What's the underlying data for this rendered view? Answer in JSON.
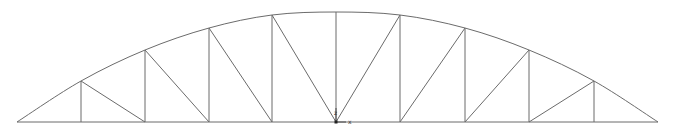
{
  "diagram": {
    "type": "bowstring-truss",
    "colors": {
      "member": "#6b6b6b",
      "axis": "#333333",
      "background": "#ffffff"
    },
    "bottom_chord_y": 122,
    "nodes_bottom_x": [
      17,
      81,
      145,
      209,
      272,
      336,
      400,
      465,
      529,
      594,
      658
    ],
    "nodes_top": [
      {
        "x": 17,
        "y": 122
      },
      {
        "x": 81,
        "y": 81
      },
      {
        "x": 145,
        "y": 50
      },
      {
        "x": 209,
        "y": 28
      },
      {
        "x": 272,
        "y": 15
      },
      {
        "x": 336,
        "y": 12
      },
      {
        "x": 400,
        "y": 15
      },
      {
        "x": 465,
        "y": 28
      },
      {
        "x": 529,
        "y": 50
      },
      {
        "x": 594,
        "y": 81
      },
      {
        "x": 658,
        "y": 122
      }
    ],
    "diagonals": [
      {
        "from": "top1",
        "to": "bot2"
      },
      {
        "from": "top2",
        "to": "bot3"
      },
      {
        "from": "top3",
        "to": "bot4"
      },
      {
        "from": "top4",
        "to": "bot5"
      },
      {
        "from": "top6",
        "to": "bot5"
      },
      {
        "from": "top7",
        "to": "bot6"
      },
      {
        "from": "top8",
        "to": "bot7"
      },
      {
        "from": "top9",
        "to": "bot8"
      }
    ],
    "axes": {
      "origin": {
        "x": 336,
        "y": 122
      },
      "x_label": "x",
      "z_label": "z"
    }
  }
}
